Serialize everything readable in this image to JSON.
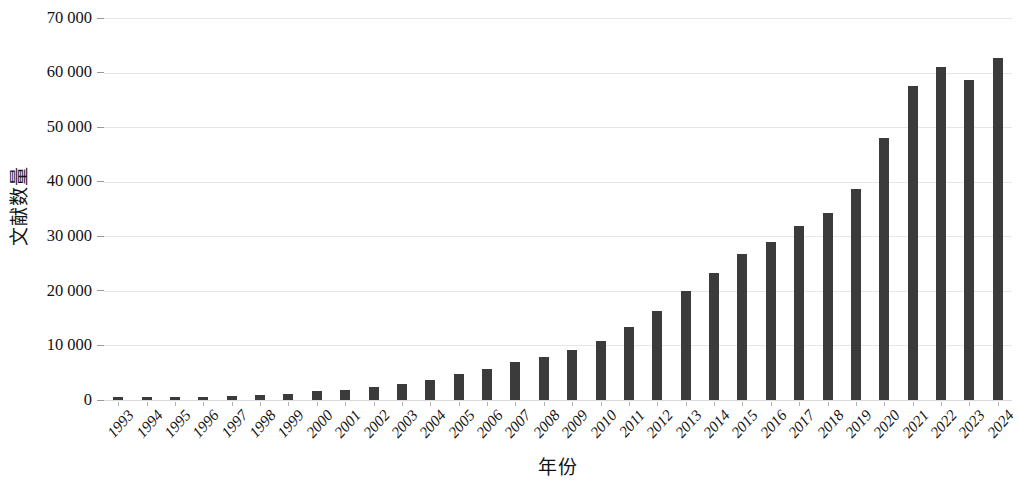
{
  "chart_data": {
    "type": "bar",
    "title": "",
    "xlabel": "年份",
    "ylabel": "文献数量",
    "categories": [
      "1993",
      "1994",
      "1995",
      "1996",
      "1997",
      "1998",
      "1999",
      "2000",
      "2001",
      "2002",
      "2003",
      "2004",
      "2005",
      "2006",
      "2007",
      "2008",
      "2009",
      "2010",
      "2011",
      "2012",
      "2013",
      "2014",
      "2015",
      "2016",
      "2017",
      "2018",
      "2019",
      "2020",
      "2021",
      "2022",
      "2023",
      "2024"
    ],
    "values": [
      300,
      400,
      500,
      600,
      700,
      900,
      1100,
      1600,
      1900,
      2300,
      2900,
      3600,
      4700,
      5700,
      6900,
      7800,
      9200,
      10800,
      13300,
      16300,
      19900,
      23300,
      26700,
      29000,
      31800,
      34300,
      38700,
      48000,
      57600,
      61000,
      58600,
      62600
    ],
    "series": [
      {
        "name": "文献数量",
        "values": [
          300,
          400,
          500,
          600,
          700,
          900,
          1100,
          1600,
          1900,
          2300,
          2900,
          3600,
          4700,
          5700,
          6900,
          7800,
          9200,
          10800,
          13300,
          16300,
          19900,
          23300,
          26700,
          29000,
          31800,
          34300,
          38700,
          48000,
          57600,
          61000,
          58600,
          62600
        ]
      }
    ],
    "ylim": [
      0,
      70000
    ],
    "yticks": [
      0,
      10000,
      20000,
      30000,
      40000,
      50000,
      60000,
      70000
    ],
    "ytick_labels": [
      "0",
      "10 000",
      "20 000",
      "30 000",
      "40 000",
      "50 000",
      "60 000",
      "70 000"
    ],
    "grid": true,
    "grid_axis": "y",
    "legend": "none",
    "bar_color": "#3b3b3b",
    "grid_color": "#e6e6e6",
    "background_color": "#ffffff",
    "bar_width_ratio": 0.36,
    "xtick_rotation": -48
  }
}
